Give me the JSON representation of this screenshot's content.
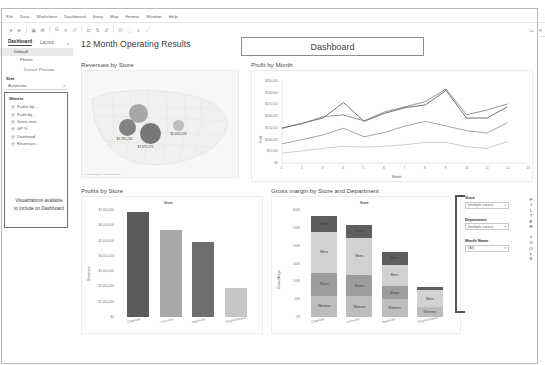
{
  "app": {
    "title": "12 Month Operating Results",
    "dashboard_box_label": "Dashboard"
  },
  "menubar": {
    "items": [
      "File",
      "Data",
      "Worksheet",
      "Dashboard",
      "Story",
      "Map",
      "Format",
      "Window",
      "Help"
    ]
  },
  "toolbar": {
    "icons": [
      "back-icon",
      "forward-icon",
      "save-icon",
      "new-worksheet-icon",
      "duplicate-icon",
      "clear-icon",
      "undo-icon",
      "redo-icon",
      "swap-icon",
      "sort-asc-icon",
      "sort-desc-icon",
      "group-icon",
      "highlight-icon",
      "labels-icon",
      "fit-icon",
      "fix-axes-icon",
      "presentation-icon",
      "show-me-icon"
    ]
  },
  "sidebar": {
    "tabs": [
      {
        "label": "Dashboard",
        "active": true
      },
      {
        "label": "Layout",
        "active": false
      }
    ],
    "device_rows": [
      {
        "label": "Default",
        "selected": true,
        "indent": 1
      },
      {
        "label": "Phone",
        "selected": false,
        "indent": 2
      },
      {
        "label": "Device Preview",
        "selected": false,
        "indent": 3
      }
    ],
    "size": {
      "label": "Size",
      "value": "Automatic",
      "caret": "▾"
    },
    "sheets": {
      "title": "Sheets",
      "items": [
        {
          "icon": "bar-chart-icon",
          "label": "Profits by ..."
        },
        {
          "icon": "line-chart-icon",
          "label": "Profit by ..."
        },
        {
          "icon": "bar-chart-icon",
          "label": "Gross mar..."
        },
        {
          "icon": "bar-chart-icon",
          "label": "GP %"
        },
        {
          "icon": "bar-chart-icon",
          "label": "Overhead ..."
        },
        {
          "icon": "map-icon",
          "label": "Revenues ..."
        }
      ],
      "note": "Visualizations available to include on Dashboard"
    }
  },
  "filters": {
    "tools_label": [
      "F",
      "I",
      "L",
      "T",
      "E",
      "R",
      "",
      "T",
      "O",
      "O",
      "L",
      "S"
    ],
    "groups": [
      {
        "label": "Store",
        "value": "(multiple values)",
        "caret": "▾"
      },
      {
        "label": "Department",
        "value": "(multiple values)",
        "caret": "▾"
      },
      {
        "label": "Month Name",
        "value": "(All)",
        "caret": "▾"
      }
    ]
  },
  "chart_data": [
    {
      "id": "map",
      "type": "map",
      "title": "Revenues by Store",
      "attribution": "© 2021 Mapbox © OpenStreetMap",
      "points": [
        {
          "label": "$4,765,240",
          "value": 4765240,
          "x": 45,
          "y": 56,
          "r": 8.5,
          "color": "#6f6f6f"
        },
        {
          "label": "$7,475,571",
          "value": 7475571,
          "x": 68,
          "y": 62,
          "r": 10.5,
          "color": "#616161"
        },
        {
          "label": "$2,094,018",
          "value": 2094018,
          "x": 96,
          "y": 54,
          "r": 5.5,
          "color": "#b4b4b4"
        },
        {
          "label": "",
          "value": 0,
          "x": 56,
          "y": 42,
          "r": 9.5,
          "color": "#9a9a9a"
        }
      ]
    },
    {
      "id": "profit_by_month",
      "type": "line",
      "title": "Profit by Month",
      "xlabel": "Month",
      "ylabel": "Profit",
      "x": [
        1,
        2,
        3,
        4,
        5,
        6,
        7,
        8,
        9,
        10,
        11,
        12,
        13
      ],
      "yticks": [
        "$350,000",
        "$300,000",
        "$250,000",
        "$200,000",
        "$150,000",
        "$100,000",
        "$50,000",
        "$0"
      ],
      "ylim": [
        0,
        350000
      ],
      "series": [
        {
          "name": "Charlotte",
          "color": "#4f4f4f",
          "values": [
            148000,
            170000,
            192000,
            258000,
            178000,
            212000,
            236000,
            248000,
            310000,
            192000,
            192000,
            240000,
            null
          ]
        },
        {
          "name": "Louisville",
          "color": "#7a7a7a",
          "values": [
            150000,
            168000,
            198000,
            205000,
            180000,
            218000,
            240000,
            262000,
            316000,
            206000,
            226000,
            252000,
            null
          ]
        },
        {
          "name": "Nashville",
          "color": "#8e8e8e",
          "values": [
            82000,
            100000,
            120000,
            148000,
            112000,
            130000,
            158000,
            178000,
            158000,
            138000,
            128000,
            172000,
            null
          ]
        },
        {
          "name": "Virginia Beach",
          "color": "#c2c2c2",
          "values": [
            42000,
            52000,
            62000,
            72000,
            68000,
            72000,
            78000,
            88000,
            88000,
            70000,
            62000,
            92000,
            null
          ]
        }
      ]
    },
    {
      "id": "profits_by_store",
      "type": "bar",
      "title": "Profits by Store",
      "xlabel": "Store",
      "ylabel": "Revenues",
      "categories": [
        "Charlotte",
        "Louisville",
        "Nashville",
        "Virginia Beach"
      ],
      "values": [
        7475571,
        6180000,
        5320000,
        2094018
      ],
      "colors": [
        "#5b5b5b",
        "#a8a8a8",
        "#6e6e6e",
        "#c6c6c6"
      ],
      "yticks": [
        "$7,000,000",
        "$6,000,000",
        "$5,000,000",
        "$4,000,000",
        "$3,000,000",
        "$2,000,000",
        "$1,000,000",
        "$0"
      ],
      "ylim": [
        0,
        7600000
      ]
    },
    {
      "id": "gross_margin",
      "type": "bar",
      "stacked": true,
      "title": "Gross margin by Store and Department",
      "xlabel": "Store",
      "ylabel": "Gross Margin",
      "categories": [
        "Charlotte",
        "Louisville",
        "Nashville",
        "Virginia Beach"
      ],
      "yticks": [
        "300K",
        "250K",
        "200K",
        "150K",
        "100K",
        "50K",
        "0K"
      ],
      "ylim": [
        0,
        310000
      ],
      "series": [
        {
          "name": "Womens",
          "color": "#bdbdbd",
          "values": [
            62000,
            60000,
            52000,
            28000
          ]
        },
        {
          "name": "Shoes",
          "color": "#9d9d9d",
          "values": [
            66000,
            62000,
            38000,
            0
          ]
        },
        {
          "name": "Mens",
          "color": "#d2d2d2",
          "values": [
            118000,
            108000,
            62000,
            50000
          ]
        },
        {
          "name": "Home",
          "color": "#5e5e5e",
          "values": [
            46000,
            38000,
            36000,
            8000
          ]
        }
      ]
    }
  ]
}
